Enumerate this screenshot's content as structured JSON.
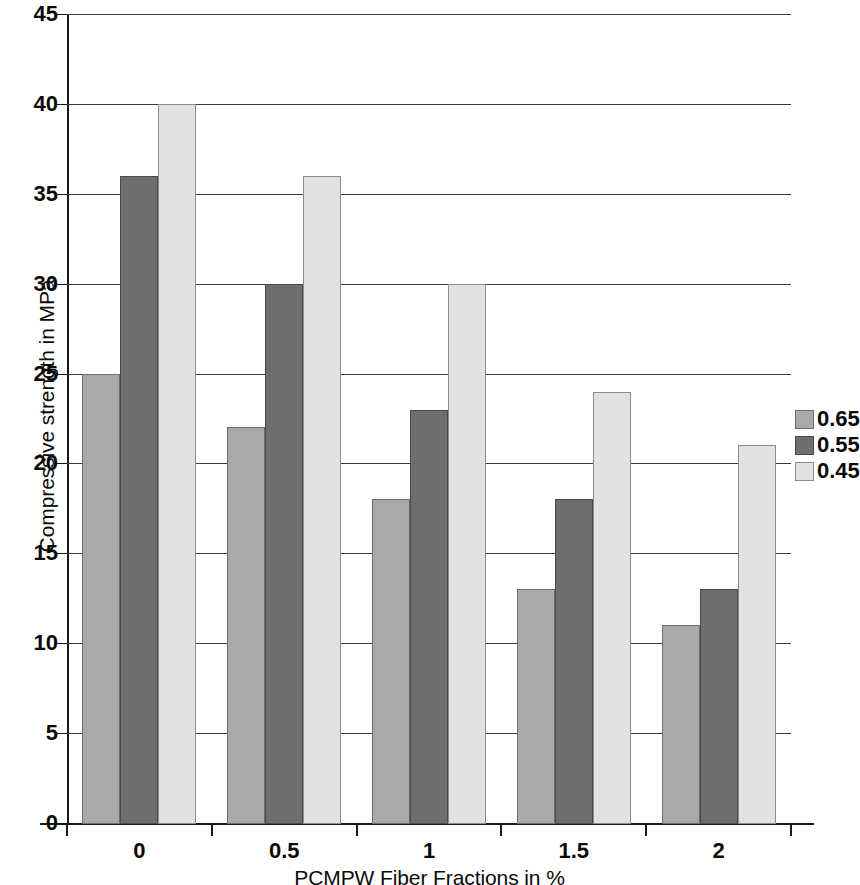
{
  "chart_data": {
    "type": "bar",
    "title": "",
    "xlabel": "PCMPW Fiber Fractions in %",
    "ylabel": "Compressive strength in MPa",
    "categories": [
      "0",
      "0.5",
      "1",
      "1.5",
      "2"
    ],
    "series": [
      {
        "name": "0.65",
        "color": "#a9a9a9",
        "values": [
          25,
          22,
          18,
          13,
          11
        ]
      },
      {
        "name": "0.55",
        "color": "#6e6e6e",
        "values": [
          36,
          30,
          23,
          18,
          13
        ]
      },
      {
        "name": "0.45",
        "color": "#e2e2e2",
        "values": [
          40,
          36,
          30,
          24,
          21
        ]
      }
    ],
    "ylim": [
      0,
      45
    ],
    "ytick_step": 5,
    "yticks": [
      "45",
      "40",
      "35",
      "30",
      "25",
      "20",
      "15",
      "10",
      "5",
      "0"
    ],
    "grid": true,
    "legend_position": "right"
  }
}
